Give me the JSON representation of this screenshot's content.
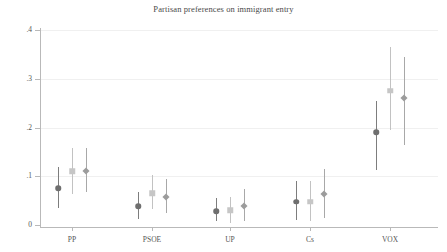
{
  "chart_data": {
    "type": "scatter",
    "title": "Partisan preferences on immigrant entry",
    "xlabel": "",
    "ylabel": "",
    "ylim": [
      0,
      0.4
    ],
    "yticks": [
      0,
      0.1,
      0.2,
      0.3,
      0.4
    ],
    "ytick_labels": [
      "0",
      ".1",
      ".2",
      ".3",
      ".4"
    ],
    "categories": [
      "PP",
      "PSOE",
      "UP",
      "Cs",
      "VOX"
    ],
    "grid": true,
    "legend": "none",
    "marker_styles": [
      "circle",
      "square",
      "diamond"
    ],
    "marker_colors": [
      "#6f6f6f",
      "#c6c6c6",
      "#9c9c9c"
    ],
    "series": [
      {
        "name": "estimate-1",
        "marker": "circle",
        "color": "#6f6f6f",
        "values": [
          0.075,
          0.038,
          0.028,
          0.048,
          0.19
        ],
        "ci_low": [
          0.035,
          0.013,
          0.008,
          0.01,
          0.113
        ],
        "ci_high": [
          0.118,
          0.068,
          0.055,
          0.09,
          0.255
        ]
      },
      {
        "name": "estimate-2",
        "marker": "square",
        "color": "#c6c6c6",
        "values": [
          0.11,
          0.065,
          0.03,
          0.048,
          0.275
        ],
        "ci_low": [
          0.063,
          0.033,
          0.005,
          0.008,
          0.195
        ],
        "ci_high": [
          0.158,
          0.103,
          0.058,
          0.09,
          0.365
        ]
      },
      {
        "name": "estimate-3",
        "marker": "diamond",
        "color": "#9c9c9c",
        "values": [
          0.11,
          0.058,
          0.038,
          0.063,
          0.26
        ],
        "ci_low": [
          0.068,
          0.025,
          0.008,
          0.015,
          0.165
        ],
        "ci_high": [
          0.158,
          0.095,
          0.073,
          0.115,
          0.345
        ]
      }
    ]
  },
  "axes": {
    "group_centers_px": [
      72,
      152,
      230,
      310,
      390
    ],
    "offsets_px": [
      -14,
      0,
      14
    ]
  }
}
